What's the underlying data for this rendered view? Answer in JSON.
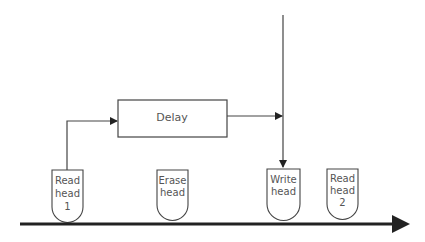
{
  "diagram": {
    "delay": {
      "label": "Delay"
    },
    "heads": [
      {
        "id": "read-head-1",
        "lines": [
          "Read",
          "head",
          "1"
        ]
      },
      {
        "id": "erase-head",
        "lines": [
          "Erase",
          "head"
        ]
      },
      {
        "id": "write-head",
        "lines": [
          "Write",
          "head"
        ]
      },
      {
        "id": "read-head-2",
        "lines": [
          "Read",
          "head",
          "2"
        ]
      }
    ],
    "colors": {
      "stroke": "#444444",
      "text": "#555555",
      "tape": "#222222"
    }
  }
}
